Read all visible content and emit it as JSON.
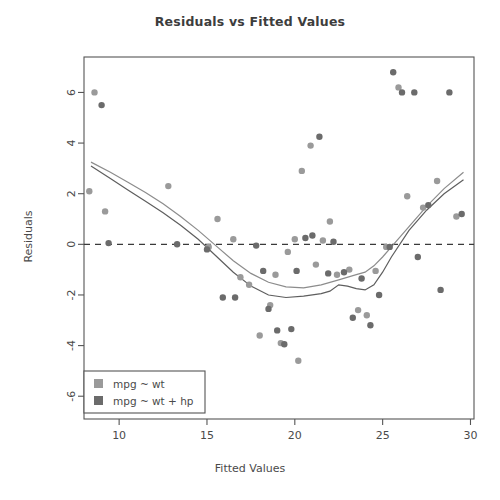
{
  "chart_data": {
    "type": "scatter",
    "title": "Residuals vs Fitted Values",
    "xlabel": "Fitted Values",
    "ylabel": "Residuals",
    "xlim": [
      8.0,
      30.2
    ],
    "ylim": [
      -6.9,
      7.4
    ],
    "xticks": [
      10,
      15,
      20,
      25,
      30
    ],
    "yticks": [
      6,
      4,
      2,
      0,
      -2,
      -4,
      -6
    ],
    "xtick_labels": [
      "10",
      "15",
      "20",
      "25",
      "30"
    ],
    "ytick_labels": [
      "6",
      "4",
      "2",
      "0",
      "-2",
      "-4",
      "-6"
    ],
    "grid": false,
    "zero_reference_line": {
      "y": 0,
      "style": "dashed",
      "color": "#3a3a3a"
    },
    "legend": {
      "position": "bottom-left",
      "entries": [
        {
          "label": "mpg ~ wt",
          "color": "#9a9a9a",
          "marker": "square"
        },
        {
          "label": "mpg ~ wt + hp",
          "color": "#6b6b6b",
          "marker": "square"
        }
      ]
    },
    "series": [
      {
        "name": "mpg ~ wt",
        "color": "#9a9a9a",
        "marker": "circle",
        "points": [
          [
            8.6,
            6.0
          ],
          [
            8.3,
            2.1
          ],
          [
            9.2,
            1.3
          ],
          [
            12.8,
            2.3
          ],
          [
            15.1,
            -0.1
          ],
          [
            15.6,
            1.0
          ],
          [
            16.5,
            0.2
          ],
          [
            16.9,
            -1.3
          ],
          [
            17.4,
            -1.6
          ],
          [
            18.0,
            -3.6
          ],
          [
            18.6,
            -2.4
          ],
          [
            18.9,
            -1.2
          ],
          [
            19.2,
            -3.9
          ],
          [
            19.6,
            -0.3
          ],
          [
            20.0,
            0.2
          ],
          [
            20.2,
            -4.6
          ],
          [
            20.4,
            2.9
          ],
          [
            20.9,
            3.9
          ],
          [
            21.2,
            -0.8
          ],
          [
            21.6,
            0.15
          ],
          [
            22.0,
            0.9
          ],
          [
            22.4,
            -1.2
          ],
          [
            23.1,
            -1.0
          ],
          [
            23.6,
            -2.6
          ],
          [
            24.1,
            -2.8
          ],
          [
            24.6,
            -1.05
          ],
          [
            25.2,
            -0.1
          ],
          [
            25.9,
            6.2
          ],
          [
            26.4,
            1.9
          ],
          [
            27.3,
            1.45
          ],
          [
            28.1,
            2.5
          ],
          [
            29.2,
            1.1
          ]
        ]
      },
      {
        "name": "mpg ~ wt + hp",
        "color": "#6b6b6b",
        "marker": "circle",
        "points": [
          [
            9.0,
            5.5
          ],
          [
            9.4,
            0.05
          ],
          [
            13.3,
            0.0
          ],
          [
            15.0,
            -0.2
          ],
          [
            15.9,
            -2.1
          ],
          [
            16.6,
            -2.1
          ],
          [
            17.8,
            -0.05
          ],
          [
            18.2,
            -1.05
          ],
          [
            18.5,
            -2.55
          ],
          [
            19.0,
            -3.4
          ],
          [
            19.4,
            -3.95
          ],
          [
            19.8,
            -3.35
          ],
          [
            20.1,
            -1.05
          ],
          [
            20.6,
            0.25
          ],
          [
            21.0,
            0.35
          ],
          [
            21.4,
            4.25
          ],
          [
            21.9,
            -1.15
          ],
          [
            22.2,
            0.1
          ],
          [
            22.8,
            -1.1
          ],
          [
            23.3,
            -2.9
          ],
          [
            23.8,
            -1.35
          ],
          [
            24.3,
            -3.2
          ],
          [
            24.8,
            -2.0
          ],
          [
            25.4,
            -0.1
          ],
          [
            25.6,
            6.8
          ],
          [
            26.1,
            6.0
          ],
          [
            26.8,
            6.0
          ],
          [
            27.0,
            -0.5
          ],
          [
            27.6,
            1.55
          ],
          [
            28.3,
            -1.8
          ],
          [
            28.8,
            6.0
          ],
          [
            29.5,
            1.2
          ]
        ]
      }
    ],
    "smoothers": [
      {
        "name": "mpg ~ wt smoother",
        "color": "#8c8c8c",
        "style": "solid",
        "points": [
          [
            8.4,
            3.25
          ],
          [
            9.5,
            2.85
          ],
          [
            10.5,
            2.45
          ],
          [
            11.5,
            2.05
          ],
          [
            12.5,
            1.6
          ],
          [
            13.5,
            1.1
          ],
          [
            14.5,
            0.55
          ],
          [
            15.5,
            -0.05
          ],
          [
            16.5,
            -0.65
          ],
          [
            17.5,
            -1.15
          ],
          [
            18.5,
            -1.5
          ],
          [
            19.5,
            -1.68
          ],
          [
            20.5,
            -1.72
          ],
          [
            21.5,
            -1.6
          ],
          [
            22.5,
            -1.4
          ],
          [
            23.5,
            -1.2
          ],
          [
            24.0,
            -1.1
          ],
          [
            24.5,
            -0.85
          ],
          [
            25.0,
            -0.5
          ],
          [
            25.5,
            -0.1
          ],
          [
            26.5,
            0.7
          ],
          [
            27.5,
            1.5
          ],
          [
            28.5,
            2.2
          ],
          [
            29.6,
            2.85
          ]
        ]
      },
      {
        "name": "mpg ~ wt + hp smoother",
        "color": "#5e5e5e",
        "style": "solid",
        "points": [
          [
            8.4,
            3.1
          ],
          [
            9.5,
            2.6
          ],
          [
            10.5,
            2.15
          ],
          [
            11.5,
            1.7
          ],
          [
            12.5,
            1.25
          ],
          [
            13.5,
            0.75
          ],
          [
            14.5,
            0.2
          ],
          [
            15.5,
            -0.45
          ],
          [
            16.5,
            -1.1
          ],
          [
            17.5,
            -1.65
          ],
          [
            18.5,
            -2.0
          ],
          [
            19.5,
            -2.1
          ],
          [
            20.5,
            -2.05
          ],
          [
            21.5,
            -1.95
          ],
          [
            22.0,
            -1.85
          ],
          [
            22.5,
            -1.6
          ],
          [
            23.0,
            -1.65
          ],
          [
            23.5,
            -1.75
          ],
          [
            24.0,
            -1.8
          ],
          [
            24.5,
            -1.6
          ],
          [
            25.0,
            -1.1
          ],
          [
            25.5,
            -0.5
          ],
          [
            26.5,
            0.55
          ],
          [
            27.5,
            1.35
          ],
          [
            28.5,
            2.0
          ],
          [
            29.6,
            2.55
          ]
        ]
      }
    ]
  }
}
